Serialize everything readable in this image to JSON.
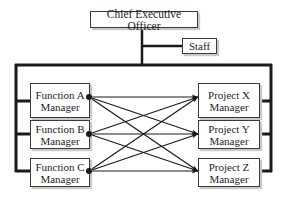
{
  "diagram": {
    "type": "matrix-organization-chart",
    "colors": {
      "line": "#1a1a1a",
      "box_border": "#3a3a3a",
      "text": "#1e1e1e",
      "shadow": "#c9c9c9"
    },
    "top": {
      "label": "Chief Executive Officer"
    },
    "staff": {
      "label": "Staff"
    },
    "functions": [
      {
        "line1": "Function A",
        "line2": "Manager"
      },
      {
        "line1": "Function B",
        "line2": "Manager"
      },
      {
        "line1": "Function C",
        "line2": "Manager"
      }
    ],
    "projects": [
      {
        "line1": "Project X",
        "line2": "Manager"
      },
      {
        "line1": "Project Y",
        "line2": "Manager"
      },
      {
        "line1": "Project Z",
        "line2": "Manager"
      }
    ],
    "connections": "each function manager connects to every project manager (3x3 arrows)"
  }
}
